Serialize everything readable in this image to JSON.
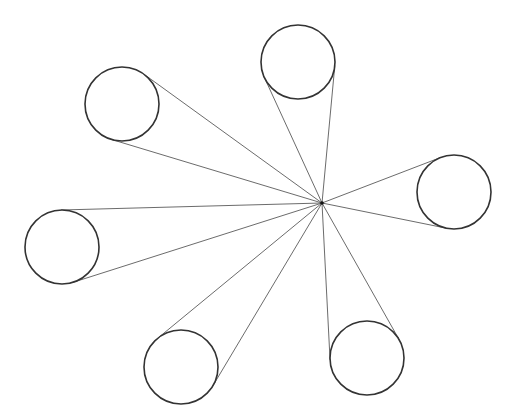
{
  "canvas": {
    "width": 515,
    "height": 418,
    "background": "#ffffff"
  },
  "colors": {
    "circle_stroke": "#333333",
    "line_stroke": "#5a5a5a",
    "focal_point": "#111111"
  },
  "focal_point": {
    "x": 322,
    "y": 203,
    "radius": 1.8
  },
  "circles": [
    {
      "id": "top",
      "cx": 298,
      "cy": 62,
      "r": 37
    },
    {
      "id": "upper-left",
      "cx": 122,
      "cy": 104,
      "r": 37
    },
    {
      "id": "right",
      "cx": 454,
      "cy": 192,
      "r": 37
    },
    {
      "id": "left",
      "cx": 62,
      "cy": 247,
      "r": 37
    },
    {
      "id": "bottom-left",
      "cx": 181,
      "cy": 367,
      "r": 37
    },
    {
      "id": "bottom-right",
      "cx": 367,
      "cy": 358,
      "r": 37
    }
  ]
}
